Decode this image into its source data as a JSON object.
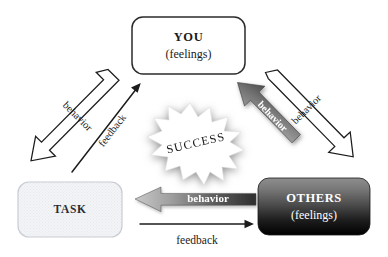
{
  "diagram": {
    "background_color": "#ffffff",
    "nodes": [
      {
        "id": "you",
        "name": "you-node",
        "label": "YOU",
        "sublabel": "(feelings)",
        "fill": "#ffffff",
        "text_color": "#1a1a1a",
        "border_color": "#2b2b2b"
      },
      {
        "id": "task",
        "name": "task-node",
        "label": "TASK",
        "sublabel": "",
        "fill": "#f2f3f4",
        "text_color": "#2b2b33",
        "border_color": "#c8ccd2"
      },
      {
        "id": "others",
        "name": "others-node",
        "label": "OTHERS",
        "sublabel": "(feelings)",
        "fill": "#3a3a3a",
        "text_color": "#ffffff",
        "border_color": "#1a1a1a"
      }
    ],
    "burst": {
      "label": "SUCCESS",
      "fill": "#ffffff",
      "text_color": "#1a1a1a",
      "shadow_color": "#9a9a9a"
    },
    "edges": [
      {
        "id": "you-to-task-behavior",
        "name": "arrow-behavior-you-to-task",
        "label": "behavior",
        "style": "hollow-block",
        "from": "you",
        "to": "task",
        "text_color": "#1a1a1a"
      },
      {
        "id": "task-to-you-feedback",
        "name": "arrow-feedback-task-to-you",
        "label": "feedback",
        "style": "thin-line",
        "from": "task",
        "to": "you",
        "text_color": "#1a1a1a"
      },
      {
        "id": "you-to-others-behavior",
        "name": "arrow-behavior-you-to-others",
        "label": "behavior",
        "style": "hollow-block",
        "from": "you",
        "to": "others",
        "text_color": "#1a1a1a"
      },
      {
        "id": "others-to-you-behavior",
        "name": "arrow-behavior-others-to-you",
        "label": "behavior",
        "style": "gradient-block",
        "from": "others",
        "to": "you",
        "text_color": "#ffffff"
      },
      {
        "id": "others-to-task-behavior",
        "name": "arrow-behavior-others-to-task",
        "label": "behavior",
        "style": "gradient-block",
        "from": "others",
        "to": "task",
        "text_color": "#ffffff"
      },
      {
        "id": "task-to-others-feedback",
        "name": "arrow-feedback-task-to-others",
        "label": "feedback",
        "style": "thin-line",
        "from": "task",
        "to": "others",
        "text_color": "#1a1a1a"
      }
    ]
  }
}
